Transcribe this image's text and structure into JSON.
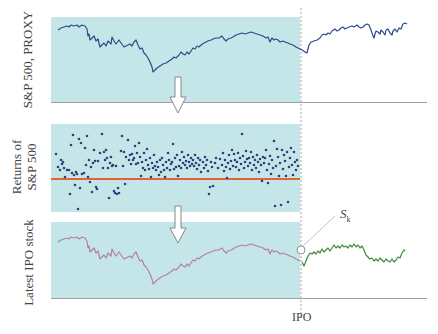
{
  "diagram": {
    "panels": [
      {
        "id": "sp500",
        "ylabel": "S&P 500, PROXY",
        "series_color": "#2c4a8a"
      },
      {
        "id": "returns",
        "ylabel_line1": "Returns of",
        "ylabel_line2": "S&P 500",
        "dot_color": "#2c3f7f",
        "mean_line_color": "#e0643a"
      },
      {
        "id": "ipo",
        "ylabel": "Latest IPO stock",
        "pre_color": "#b27fa6",
        "post_color": "#3a8a3a"
      }
    ],
    "annotations": {
      "ipo_marker": "IPO",
      "s_label": "S",
      "s_subscript": "k"
    },
    "colors": {
      "panel_fill": "#c5e6e9",
      "axis": "#9aa0a4",
      "arrow_fill": "#ffffff",
      "arrow_stroke": "#888888"
    }
  }
}
